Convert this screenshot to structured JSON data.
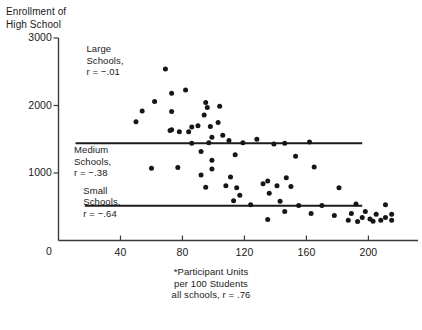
{
  "chart_data": {
    "type": "scatter",
    "title": "",
    "ylabel": "Enrollment of\nHigh School",
    "xlabel": "",
    "xlim": [
      0,
      232
    ],
    "ylim": [
      0,
      3000
    ],
    "grid": false,
    "legend": "none",
    "y_ticks": [
      {
        "value": 3000,
        "label": "3000"
      },
      {
        "value": 2000,
        "label": "2000"
      },
      {
        "value": 1000,
        "label": "1000"
      },
      {
        "value": 0,
        "label": "0"
      }
    ],
    "x_ticks": [
      {
        "value": 40,
        "label": "40"
      },
      {
        "value": 80,
        "label": "80"
      },
      {
        "value": 120,
        "label": "120"
      },
      {
        "value": 160,
        "label": "160"
      },
      {
        "value": 200,
        "label": "200"
      }
    ],
    "annotations": [
      {
        "name": "large-schools",
        "text": "Large\nSchools,\nr = −.01",
        "x": 18,
        "y": 2830
      },
      {
        "name": "medium-schools",
        "text": "Medium\nSchools,\nr = −.38",
        "x": 10,
        "y": 1340
      },
      {
        "name": "small-schools",
        "text": "Small\nSchools,\nr = −.64",
        "x": 16,
        "y": 740
      }
    ],
    "footnote": "*Participant Units\nper 100 Students\nall schools, r = .76",
    "reference_lines": [
      {
        "name": "medium-schools-divider",
        "y": 1440,
        "x_start": 11,
        "x_end": 196
      },
      {
        "name": "small-schools-divider",
        "y": 515,
        "x_start": 17,
        "x_end": 196
      }
    ],
    "points": [
      [
        50,
        1760
      ],
      [
        62,
        2060
      ],
      [
        73,
        2180
      ],
      [
        54,
        1920
      ],
      [
        73,
        1910
      ],
      [
        82,
        2230
      ],
      [
        86,
        1680
      ],
      [
        69,
        2540
      ],
      [
        73,
        1640
      ],
      [
        72,
        1630
      ],
      [
        78,
        1610
      ],
      [
        84,
        1610
      ],
      [
        95,
        2045
      ],
      [
        96,
        1970
      ],
      [
        94,
        1860
      ],
      [
        104,
        1990
      ],
      [
        103,
        1750
      ],
      [
        98,
        1690
      ],
      [
        90,
        1700
      ],
      [
        99,
        1530
      ],
      [
        106,
        1560
      ],
      [
        110,
        1480
      ],
      [
        128,
        1500
      ],
      [
        119,
        1450
      ],
      [
        86,
        1440
      ],
      [
        97,
        1450
      ],
      [
        139,
        1430
      ],
      [
        146,
        1440
      ],
      [
        162,
        1460
      ],
      [
        92,
        1320
      ],
      [
        99,
        1190
      ],
      [
        114,
        1270
      ],
      [
        153,
        1250
      ],
      [
        60,
        1070
      ],
      [
        77,
        1080
      ],
      [
        99,
        1060
      ],
      [
        165,
        1090
      ],
      [
        92,
        970
      ],
      [
        111,
        940
      ],
      [
        108,
        810
      ],
      [
        115,
        780
      ],
      [
        95,
        790
      ],
      [
        132,
        840
      ],
      [
        141,
        810
      ],
      [
        135,
        880
      ],
      [
        147,
        930
      ],
      [
        150,
        800
      ],
      [
        117,
        670
      ],
      [
        136,
        700
      ],
      [
        113,
        590
      ],
      [
        143,
        580
      ],
      [
        181,
        780
      ],
      [
        124,
        530
      ],
      [
        155,
        520
      ],
      [
        170,
        520
      ],
      [
        192,
        540
      ],
      [
        211,
        530
      ],
      [
        146,
        430
      ],
      [
        163,
        400
      ],
      [
        189,
        400
      ],
      [
        198,
        430
      ],
      [
        178,
        370
      ],
      [
        135,
        310
      ],
      [
        187,
        300
      ],
      [
        205,
        390
      ],
      [
        211,
        340
      ],
      [
        215,
        390
      ],
      [
        196,
        340
      ],
      [
        201,
        320
      ],
      [
        208,
        300
      ],
      [
        215,
        300
      ],
      [
        193,
        280
      ],
      [
        203,
        285
      ]
    ]
  }
}
